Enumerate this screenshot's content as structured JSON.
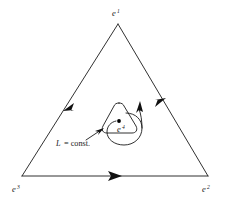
{
  "figure": {
    "background_color": "#ffffff",
    "stroke_color": "#1a1a1a",
    "width": 226,
    "height": 199
  },
  "outer_triangle": {
    "name": "outer-triangle",
    "vertices": [
      {
        "id": "apex",
        "label_base": "e",
        "label_sup": "1",
        "x": 118,
        "y": 24,
        "label_x": 112,
        "label_y": 14
      },
      {
        "id": "bottom-right",
        "label_base": "e",
        "label_sup": "2",
        "x": 208,
        "y": 176,
        "label_x": 203,
        "label_y": 191
      },
      {
        "id": "bottom-left",
        "label_base": "e",
        "label_sup": "3",
        "x": 22,
        "y": 176,
        "label_x": 13,
        "label_y": 191
      }
    ],
    "edges": [
      {
        "id": "edge-apex-to-bottom-left",
        "direction": "down-left",
        "arrow_t": 0.54
      },
      {
        "id": "edge-bottom-left-to-bottom-right",
        "direction": "right",
        "arrow_t": 0.6
      },
      {
        "id": "edge-bottom-right-to-apex",
        "direction": "up-right",
        "arrow_t": 0.45
      }
    ],
    "orientation": "counterclockwise"
  },
  "inner_contour": {
    "name": "inner-rounded-triangle",
    "label": "L = const.",
    "label_italic_part": "L",
    "label_rest": "= const.",
    "label_x": 56,
    "label_y": 145,
    "center_x": 120,
    "center_y": 122,
    "pointer": {
      "from_x": 88,
      "from_y": 140,
      "to_x": 103,
      "to_y": 129
    }
  },
  "inner_point": {
    "name": "interior-point",
    "label_base": "e",
    "label_sup": "4",
    "dot_x": 119,
    "dot_y": 121,
    "dot_r": 1.9,
    "label_x": 120,
    "label_y": 132
  },
  "loop_arrow": {
    "name": "circulation-arrow",
    "direction": "counterclockwise",
    "head_x": 141,
    "head_y": 106
  }
}
